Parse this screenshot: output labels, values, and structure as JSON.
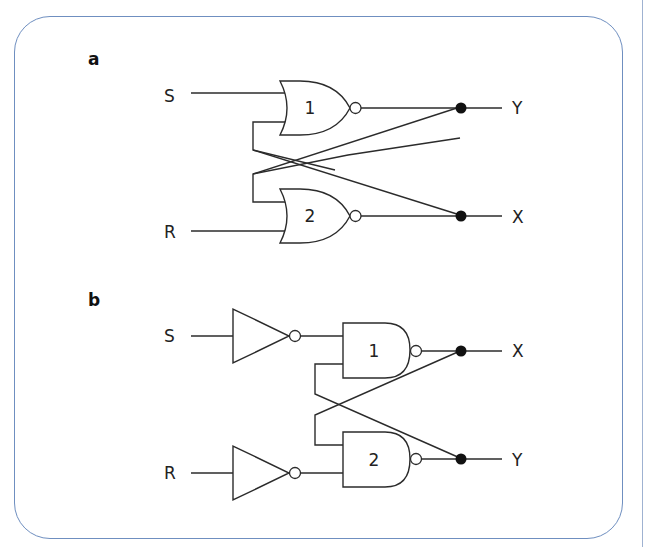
{
  "diagram": {
    "colors": {
      "frame": "#6f8fc0",
      "line": "#2b2b2b",
      "junction": "#111111"
    },
    "panel_a": {
      "label": "a",
      "gate_type": "NOR",
      "inputs": {
        "top": "S",
        "bottom": "R"
      },
      "gates": [
        {
          "label": "1"
        },
        {
          "label": "2"
        }
      ],
      "outputs": {
        "top": "Y",
        "bottom": "X"
      }
    },
    "panel_b": {
      "label": "b",
      "gate_type": "NAND",
      "input_inverters": 2,
      "inputs": {
        "top": "S",
        "bottom": "R"
      },
      "gates": [
        {
          "label": "1"
        },
        {
          "label": "2"
        }
      ],
      "outputs": {
        "top": "X",
        "bottom": "Y"
      }
    }
  }
}
